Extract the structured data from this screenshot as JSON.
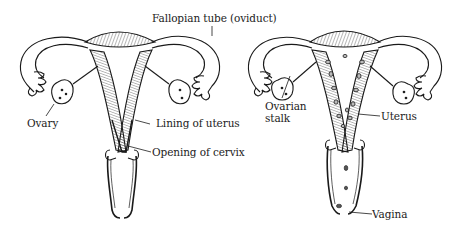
{
  "diagram": {
    "left_figure": {
      "labels": {
        "fallopian_tube": "Fallopian tube (oviduct)",
        "ovary": "Ovary",
        "lining_of_uterus": "Lining of uterus",
        "opening_of_cervix": "Opening of cervix"
      }
    },
    "right_figure": {
      "labels": {
        "ovarian_stalk_line1": "Ovarian",
        "ovarian_stalk_line2": "stalk",
        "uterus": "Uterus",
        "vagina": "Vagina"
      }
    },
    "colors": {
      "ink": "#1a1a1a",
      "background": "#ffffff"
    }
  }
}
